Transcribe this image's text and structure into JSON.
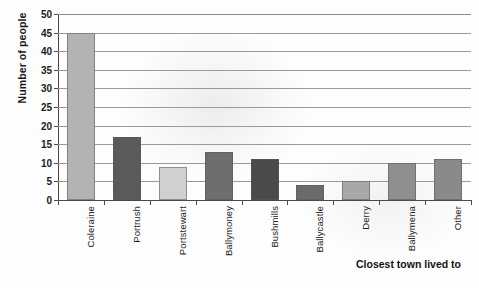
{
  "chart_data": {
    "type": "bar",
    "title": "",
    "xlabel": "Closest town lived to",
    "ylabel": "Number of people",
    "categories": [
      "Coleraine",
      "Portrush",
      "Portstewart",
      "Ballymoney",
      "Bushmills",
      "Ballycastle",
      "Derry",
      "Ballymena",
      "Other"
    ],
    "values": [
      45,
      17,
      9,
      13,
      11,
      4,
      5,
      10,
      11
    ],
    "bar_colors": [
      "#b3b3b3",
      "#5a5a5a",
      "#d0d0d0",
      "#6e6e6e",
      "#4a4a4a",
      "#6b6b6b",
      "#a8a8a8",
      "#8f8f8f",
      "#8a8a8a"
    ],
    "ylim": [
      0,
      50
    ],
    "ytick_step": 5,
    "ytick_labels": [
      "0",
      "5",
      "10",
      "15",
      "20",
      "25",
      "30",
      "35",
      "40",
      "45",
      "50"
    ],
    "grid": true,
    "legend": "none"
  },
  "axis": {
    "y_title": "Number of people",
    "x_title": "Closest town lived to"
  },
  "colors": {
    "grid": "#9a9a9a",
    "axis": "#4a4a4a",
    "text": "#1c1c1c",
    "background": "#fdfdfd"
  }
}
